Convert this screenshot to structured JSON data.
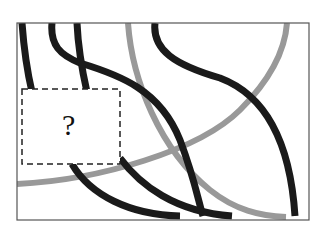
{
  "puzzle": {
    "type": "missing-piece",
    "missing_region_label": "?",
    "frame": {
      "x": 17,
      "y": 23,
      "width": 292,
      "height": 197
    },
    "missing_region": {
      "x": 22,
      "y": 89,
      "width": 98,
      "height": 75
    },
    "colors": {
      "dark_curve": "#1a1a1a",
      "gray_curve": "#999999",
      "frame": "#555555",
      "background": "#ffffff"
    },
    "curves": [
      {
        "id": "black-1",
        "color": "dark"
      },
      {
        "id": "black-2",
        "color": "dark"
      },
      {
        "id": "black-3",
        "color": "dark"
      },
      {
        "id": "black-4",
        "color": "dark"
      },
      {
        "id": "gray-1",
        "color": "gray"
      },
      {
        "id": "gray-2",
        "color": "gray"
      }
    ]
  }
}
